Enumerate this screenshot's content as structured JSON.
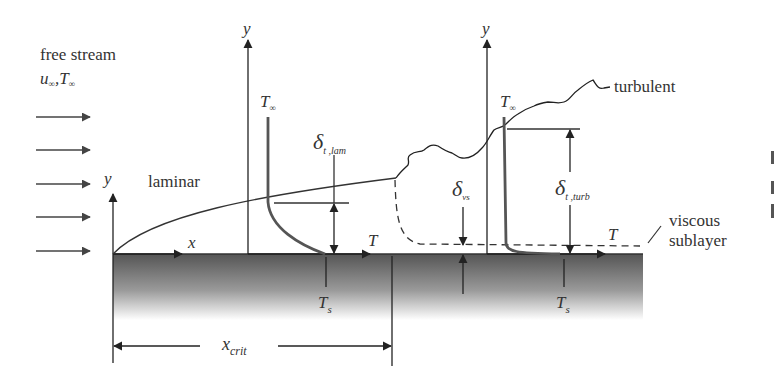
{
  "diagram": {
    "colors": {
      "line": "#222222",
      "profile": "#555555",
      "text": "#333333",
      "plate_top": "#555555",
      "plate_bottom": "#ffffff"
    },
    "labels": {
      "free_stream": "free stream",
      "free_stream_vars_u": "u",
      "free_stream_vars_sub": "∞",
      "free_stream_sep": ",",
      "free_stream_vars_T": "T",
      "laminar": "laminar",
      "turbulent": "turbulent",
      "viscous_1": "viscous",
      "viscous_2": "sublayer",
      "y_origin": "y",
      "y_lam": "y",
      "y_turb": "y",
      "x": "x",
      "T_lam": "T",
      "T_turb": "T",
      "T_inf_lam": "T",
      "T_inf_lam_sub": "∞",
      "T_inf_turb": "T",
      "T_inf_turb_sub": "∞",
      "delta_lam": "δ",
      "delta_lam_sub": "t ,lam",
      "delta_vs": "δ",
      "delta_vs_sub": "vs",
      "delta_turb": "δ",
      "delta_turb_sub": "t ,turb",
      "Ts_lam": "T",
      "Ts_lam_sub": "s",
      "Ts_turb": "T",
      "Ts_turb_sub": "s",
      "x_crit": "x",
      "x_crit_sub": "crit"
    },
    "free_stream_arrows": 5,
    "regions": [
      "laminar",
      "transition",
      "turbulent"
    ]
  }
}
